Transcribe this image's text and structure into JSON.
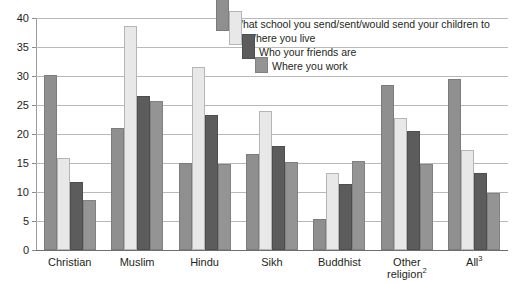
{
  "chart_data": {
    "type": "bar",
    "title": "",
    "subtitle": "",
    "xlabel": "",
    "ylabel": "",
    "ylim": [
      0,
      40
    ],
    "ytick_step": 5,
    "yticks": [
      "0",
      "5",
      "10",
      "15",
      "20",
      "25",
      "30",
      "35",
      "40"
    ],
    "grid": "horizontal",
    "legend_position": "top-right-inside",
    "categories": [
      "Christian",
      "Muslim",
      "Hindu",
      "Sikh",
      "Buddhist",
      "Other religion",
      "All"
    ],
    "category_footnotes": [
      "",
      "",
      "",
      "",
      "",
      "2",
      "3"
    ],
    "series": [
      {
        "name": "What school you send/sent/would send your children to",
        "color": "#8f8f8f",
        "values": [
          30.2,
          21.1,
          15.0,
          16.5,
          5.3,
          28.5,
          29.4
        ]
      },
      {
        "name": "Where you live",
        "color": "#e8e8e8",
        "values": [
          15.8,
          38.7,
          31.6,
          24.0,
          13.3,
          22.8,
          17.2
        ]
      },
      {
        "name": "Who your friends are",
        "color": "#5c5c5c",
        "values": [
          11.8,
          26.6,
          23.3,
          17.9,
          11.4,
          20.5,
          13.2
        ]
      },
      {
        "name": "Where you work",
        "color": "#949494",
        "values": [
          8.7,
          25.7,
          14.8,
          15.2,
          15.3,
          14.9,
          9.8
        ]
      }
    ]
  }
}
